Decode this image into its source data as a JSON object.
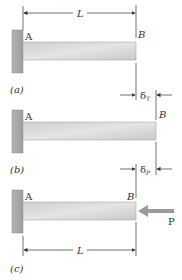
{
  "figure": {
    "panels": [
      {
        "id": "a",
        "caption": "(a)",
        "label_A": "A",
        "label_B": "B",
        "dimension_label": "L",
        "delta_label": "δ",
        "delta_subscript": "T"
      },
      {
        "id": "b",
        "caption": "(b)",
        "label_A": "A",
        "label_B": "B",
        "delta_label": "δ",
        "delta_subscript": "P"
      },
      {
        "id": "c",
        "caption": "(c)",
        "label_A": "A",
        "label_B": "B",
        "force_label": "P",
        "dimension_label": "L"
      }
    ],
    "colors": {
      "wall": "#a9a9a9",
      "wall_edge": "#8a8a8a",
      "beam": "#d6d6d6",
      "beam_edge": "#9a9a9a",
      "line": "#333333",
      "force_arrow": "#9a9a9a"
    }
  }
}
